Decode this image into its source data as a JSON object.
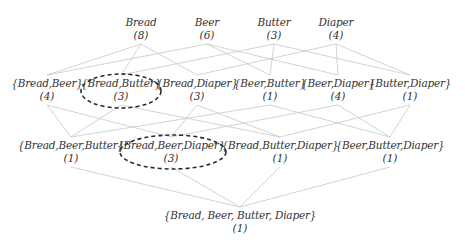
{
  "diagram": {
    "type": "itemset-lattice",
    "colors": {
      "edge": "#c8c8c8",
      "text": "#333333",
      "highlight": "#2a2a2a",
      "background": "#ffffff"
    },
    "levels": [
      {
        "nodes": [
          {
            "id": "Bd",
            "label": "Bread",
            "count": "(8)",
            "x": 141,
            "y": 16
          },
          {
            "id": "Be",
            "label": "Beer",
            "count": "(6)",
            "x": 207,
            "y": 16
          },
          {
            "id": "Bu",
            "label": "Butter",
            "count": "(3)",
            "x": 274,
            "y": 16
          },
          {
            "id": "Di",
            "label": "Diaper",
            "count": "(4)",
            "x": 336,
            "y": 16
          }
        ]
      },
      {
        "nodes": [
          {
            "id": "BdBe",
            "label": "{Bread,Beer}",
            "count": "(4)",
            "x": 47,
            "y": 77
          },
          {
            "id": "BdBu",
            "label": "{Bread,Butter}",
            "count": "(3)",
            "x": 121,
            "y": 77
          },
          {
            "id": "BdDi",
            "label": "{Bread,Diaper}",
            "count": "(3)",
            "x": 197,
            "y": 77
          },
          {
            "id": "BeBu",
            "label": "{Beer,Butter}",
            "count": "(1)",
            "x": 270,
            "y": 77
          },
          {
            "id": "BeDi",
            "label": "{Beer,Diaper}",
            "count": "(4)",
            "x": 338,
            "y": 77
          },
          {
            "id": "BuDi",
            "label": "{Butter,Diaper}",
            "count": "(1)",
            "x": 410,
            "y": 77
          }
        ]
      },
      {
        "nodes": [
          {
            "id": "BdBeBu",
            "label": "{Bread,Beer,Butter}",
            "count": "(1)",
            "x": 71,
            "y": 139
          },
          {
            "id": "BdBeDi",
            "label": "{Bread,Beer,Diaper}",
            "count": "(3)",
            "x": 171,
            "y": 139
          },
          {
            "id": "BdBuDi",
            "label": "{Bread,Butter,Diaper}",
            "count": "(1)",
            "x": 280,
            "y": 139
          },
          {
            "id": "BeBuDi",
            "label": "{Beer,Butter,Diaper}",
            "count": "(1)",
            "x": 390,
            "y": 139
          }
        ]
      },
      {
        "nodes": [
          {
            "id": "All",
            "label": "{Bread, Beer, Butter, Diaper}",
            "count": "(1)",
            "x": 240,
            "y": 209
          }
        ]
      }
    ],
    "highlighted": [
      {
        "node": "BdBu",
        "cx": 121,
        "cy": 91,
        "rx": 40,
        "ry": 17
      },
      {
        "node": "BdBeDi",
        "cx": 173,
        "cy": 152,
        "rx": 53,
        "ry": 17
      }
    ],
    "edges": [
      [
        "Bd",
        "BdBe"
      ],
      [
        "Bd",
        "BdBu"
      ],
      [
        "Bd",
        "BdDi"
      ],
      [
        "Be",
        "BdBe"
      ],
      [
        "Be",
        "BeBu"
      ],
      [
        "Be",
        "BeDi"
      ],
      [
        "Bu",
        "BdBu"
      ],
      [
        "Bu",
        "BeBu"
      ],
      [
        "Bu",
        "BuDi"
      ],
      [
        "Di",
        "BdDi"
      ],
      [
        "Di",
        "BeDi"
      ],
      [
        "Di",
        "BuDi"
      ],
      [
        "BdBe",
        "BdBeBu"
      ],
      [
        "BdBe",
        "BdBeDi"
      ],
      [
        "BdBu",
        "BdBeBu"
      ],
      [
        "BdBu",
        "BdBuDi"
      ],
      [
        "BdDi",
        "BdBeDi"
      ],
      [
        "BdDi",
        "BdBuDi"
      ],
      [
        "BeBu",
        "BdBeBu"
      ],
      [
        "BeBu",
        "BeBuDi"
      ],
      [
        "BeDi",
        "BdBeDi"
      ],
      [
        "BeDi",
        "BeBuDi"
      ],
      [
        "BuDi",
        "BdBuDi"
      ],
      [
        "BuDi",
        "BeBuDi"
      ],
      [
        "BdBeBu",
        "All"
      ],
      [
        "BdBeDi",
        "All"
      ],
      [
        "BdBuDi",
        "All"
      ],
      [
        "BeBuDi",
        "All"
      ]
    ]
  }
}
